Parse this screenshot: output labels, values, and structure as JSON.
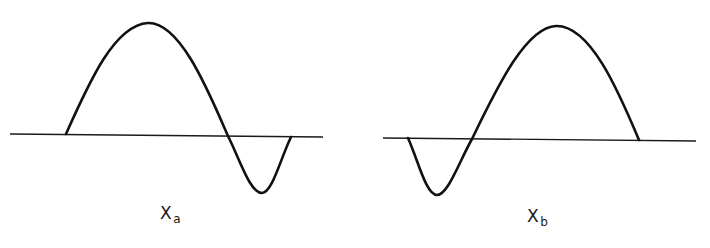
{
  "figure": {
    "panels": [
      {
        "id": "a",
        "label_main": "X",
        "label_sub": "a",
        "description": "Waveform with large positive lobe followed by smaller negative lobe"
      },
      {
        "id": "b",
        "label_main": "X",
        "label_sub": "b",
        "description": "Waveform with smaller negative lobe followed by large positive lobe"
      }
    ],
    "colors": {
      "stroke": "#111111",
      "background": "#ffffff"
    }
  }
}
